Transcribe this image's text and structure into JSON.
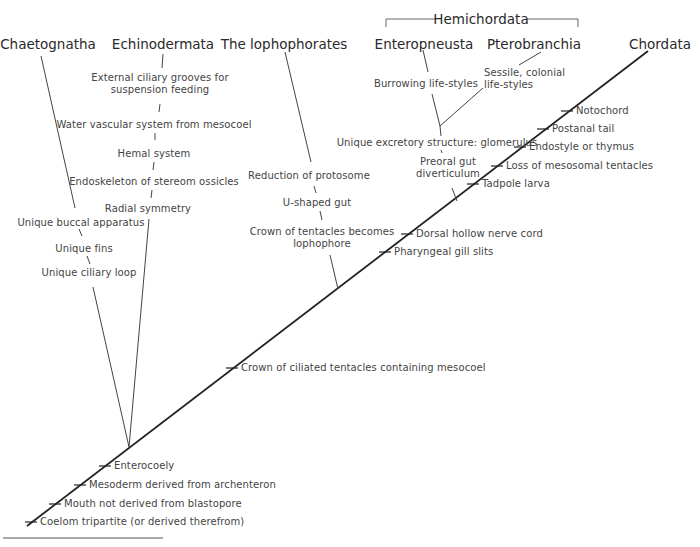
{
  "diagram": {
    "type": "cladogram",
    "group_label": "Hemichordata",
    "taxa": [
      {
        "id": "chaetognatha",
        "label": "Chaetognatha"
      },
      {
        "id": "echinodermata",
        "label": "Echinodermata"
      },
      {
        "id": "lophophorates",
        "label": "The lophophorates"
      },
      {
        "id": "enteropneusta",
        "label": "Enteropneusta"
      },
      {
        "id": "pterobranchia",
        "label": "Pterobranchia"
      },
      {
        "id": "chordata",
        "label": "Chordata"
      }
    ],
    "main_axis_characters": [
      "Coelom tripartite (or derived therefrom)",
      "Mouth not derived from blastopore",
      "Mesoderm derived from archenteron",
      "Enterocoely",
      "Crown of ciliated tentacles containing mesocoel",
      "Pharyngeal gill slits",
      "Dorsal hollow nerve cord",
      "Tadpole larva",
      "Loss of mesosomal tentacles",
      "Endostyle or thymus",
      "Postanal tail",
      "Notochord"
    ],
    "chaetognatha_characters": [
      "Unique buccal apparatus",
      "Unique fins",
      "Unique ciliary loop"
    ],
    "echinodermata_characters": [
      "External ciliary grooves for\nsuspension feeding",
      "Water vascular system from mesocoel",
      "Hemal system",
      "Endoskeleton of stereom ossicles",
      "Radial symmetry"
    ],
    "lophophorate_characters": [
      "Reduction of protosome",
      "U-shaped gut",
      "Crown of tentacles becomes\nlophophore"
    ],
    "hemichordate_characters": {
      "shared": [
        "Unique excretory structure: glomerulus",
        "Preoral gut\ndiverticulum"
      ],
      "enteropneusta": "Burrowing life-styles",
      "pterobranchia": "Sessile, colonial\nlife-styles"
    }
  }
}
